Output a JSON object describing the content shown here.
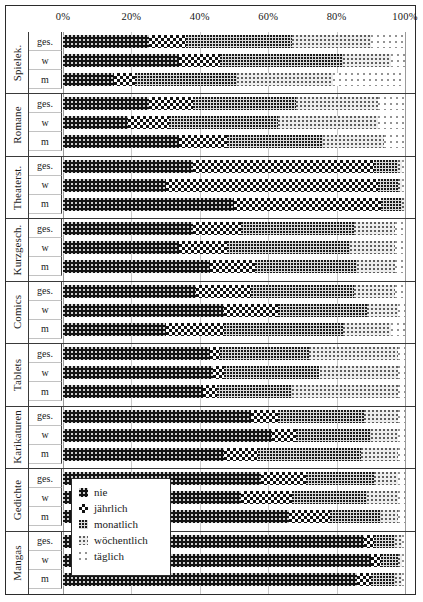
{
  "axis": {
    "ticks": [
      "0%",
      "20%",
      "40%",
      "60%",
      "80%",
      "100%"
    ],
    "min": 0,
    "max": 100
  },
  "legend": {
    "title": "",
    "items": [
      {
        "label": "nie",
        "key": "nie",
        "pattern": "solid-black-speckle",
        "color": "#141414"
      },
      {
        "label": "jährlich",
        "key": "jaehrlich",
        "pattern": "checkerboard",
        "color": "#111111"
      },
      {
        "label": "monatlich",
        "key": "monatlich",
        "pattern": "dense-dots-grey",
        "color": "#d9d9d9"
      },
      {
        "label": "wöchentlich",
        "key": "woechentlich",
        "pattern": "light-dots",
        "color": "#ededed"
      },
      {
        "label": "täglich",
        "key": "taeglich",
        "pattern": "sparse-dots-white",
        "color": "#ffffff"
      }
    ]
  },
  "row_labels": [
    "ges.",
    "w",
    "m"
  ],
  "chart_data": {
    "type": "bar",
    "orientation": "horizontal",
    "stacked": true,
    "normalized": true,
    "title": "",
    "xlabel": "",
    "ylabel": "",
    "xlim": [
      0,
      100
    ],
    "grid": true,
    "legend_position": "inside-bottom-left",
    "series": [
      {
        "name": "nie"
      },
      {
        "name": "jährlich"
      },
      {
        "name": "monatlich"
      },
      {
        "name": "wöchentlich"
      },
      {
        "name": "täglich"
      }
    ],
    "categories": [
      "Spielek.",
      "Romane",
      "Theaterst.",
      "Kurzgesch.",
      "Comics",
      "Tablets",
      "Karikaturen",
      "Gedichte",
      "Mangas"
    ],
    "subgroups": [
      "ges.",
      "w",
      "m"
    ],
    "groups": [
      {
        "category": "Spielek.",
        "bars": [
          {
            "label": "ges.",
            "values": [
              25,
              11,
              31,
              23,
              10
            ]
          },
          {
            "label": "w",
            "values": [
              34,
              12,
              36,
              14,
              4
            ]
          },
          {
            "label": "m",
            "values": [
              15,
              6,
              30,
              28,
              21
            ]
          }
        ]
      },
      {
        "category": "Romane",
        "bars": [
          {
            "label": "ges.",
            "values": [
              25,
              13,
              30,
              24,
              8
            ]
          },
          {
            "label": "w",
            "values": [
              19,
              12,
              32,
              29,
              8
            ]
          },
          {
            "label": "m",
            "values": [
              34,
              14,
              28,
              18,
              6
            ]
          }
        ]
      },
      {
        "category": "Theaterst.",
        "bars": [
          {
            "label": "ges.",
            "values": [
              38,
              53,
              7,
              1,
              1
            ]
          },
          {
            "label": "w",
            "values": [
              30,
              62,
              6,
              1,
              1
            ]
          },
          {
            "label": "m",
            "values": [
              50,
              43,
              6,
              1,
              0
            ]
          }
        ]
      },
      {
        "category": "Kurzgesch.",
        "bars": [
          {
            "label": "ges.",
            "values": [
              38,
              14,
              33,
              12,
              3
            ]
          },
          {
            "label": "w",
            "values": [
              34,
              14,
              36,
              13,
              3
            ]
          },
          {
            "label": "m",
            "values": [
              43,
              13,
              30,
              11,
              3
            ]
          }
        ]
      },
      {
        "category": "Comics",
        "bars": [
          {
            "label": "ges.",
            "values": [
              39,
              16,
              30,
              12,
              3
            ]
          },
          {
            "label": "w",
            "values": [
              47,
              16,
              26,
              9,
              2
            ]
          },
          {
            "label": "m",
            "values": [
              30,
              17,
              35,
              14,
              4
            ]
          }
        ]
      },
      {
        "category": "Tablets",
        "bars": [
          {
            "label": "ges.",
            "values": [
              43,
              3,
              26,
              26,
              2
            ]
          },
          {
            "label": "w",
            "values": [
              44,
              3,
              28,
              23,
              2
            ]
          },
          {
            "label": "m",
            "values": [
              41,
              4,
              22,
              31,
              2
            ]
          }
        ]
      },
      {
        "category": "Karikaturen",
        "bars": [
          {
            "label": "ges.",
            "values": [
              55,
              8,
              25,
              10,
              2
            ]
          },
          {
            "label": "w",
            "values": [
              61,
              7,
              22,
              8,
              2
            ]
          },
          {
            "label": "m",
            "values": [
              47,
              10,
              30,
              11,
              2
            ]
          }
        ]
      },
      {
        "category": "Gedichte",
        "bars": [
          {
            "label": "ges.",
            "values": [
              58,
              13,
              20,
              7,
              2
            ]
          },
          {
            "label": "w",
            "values": [
              52,
              15,
              22,
              9,
              2
            ]
          },
          {
            "label": "m",
            "values": [
              66,
              12,
              15,
              5,
              2
            ]
          }
        ]
      },
      {
        "category": "Mangas",
        "bars": [
          {
            "label": "ges.",
            "values": [
              88,
              3,
              6,
              2,
              1
            ]
          },
          {
            "label": "w",
            "values": [
              90,
              3,
              5,
              1,
              1
            ]
          },
          {
            "label": "m",
            "values": [
              86,
              4,
              7,
              2,
              1
            ]
          }
        ]
      }
    ]
  }
}
